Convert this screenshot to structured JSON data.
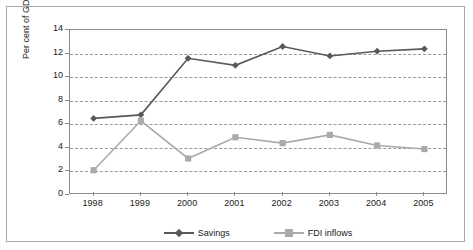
{
  "chart_data": {
    "type": "line",
    "title": "",
    "xlabel": "",
    "ylabel": "Per cent of GDP",
    "categories": [
      "1998",
      "1999",
      "2000",
      "2001",
      "2002",
      "2003",
      "2004",
      "2005"
    ],
    "ylim": [
      0,
      14
    ],
    "yticks": [
      0,
      2,
      4,
      6,
      8,
      10,
      12,
      14
    ],
    "grid": "horizontal-dashed",
    "legend_position": "bottom-center",
    "series": [
      {
        "name": "Savings",
        "color": "#595959",
        "marker": "diamond",
        "values": [
          6.5,
          6.8,
          11.6,
          11.0,
          12.6,
          11.8,
          12.2,
          12.4
        ]
      },
      {
        "name": "FDI inflows",
        "color": "#aaaaaa",
        "marker": "square",
        "values": [
          2.1,
          6.3,
          3.1,
          4.9,
          4.4,
          5.1,
          4.2,
          3.9
        ]
      }
    ]
  },
  "axis": {
    "y_label": "Per cent of GDP",
    "y_tick_labels": [
      "0",
      "2",
      "4",
      "6",
      "8",
      "10",
      "12",
      "14"
    ],
    "x_tick_labels": [
      "1998",
      "1999",
      "2000",
      "2001",
      "2002",
      "2003",
      "2004",
      "2005"
    ]
  },
  "legend": {
    "items": [
      {
        "label": "Savings",
        "color": "#595959"
      },
      {
        "label": "FDI inflows",
        "color": "#aaaaaa"
      }
    ]
  },
  "colors": {
    "savings": "#595959",
    "fdi": "#aaaaaa",
    "grid": "#999999",
    "axis": "#8c8c8c",
    "frame": "#a9a9a9",
    "text": "#1a1a1a",
    "background": "#ffffff"
  }
}
